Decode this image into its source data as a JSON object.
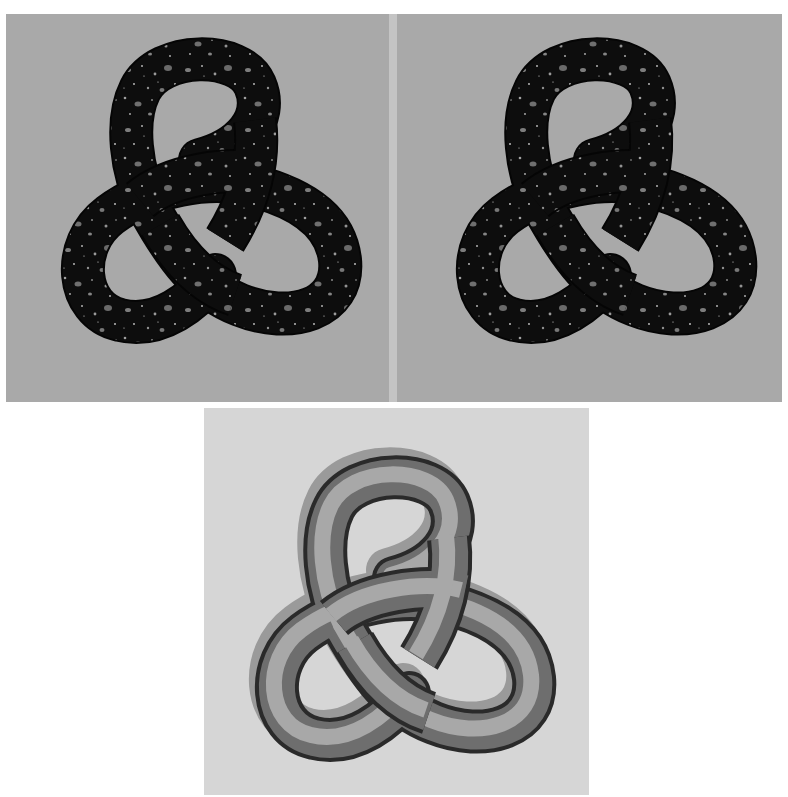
{
  "figure": {
    "panels": [
      {
        "id": "top-left",
        "subject": "trefoil knot",
        "material": "speckled granite / terrazzo texture (dark with light flecks)",
        "background": "#a9a9a9",
        "knot_color": "#111111",
        "speckle_color": "#8c8c8c"
      },
      {
        "id": "top-right",
        "subject": "trefoil knot",
        "material": "speckled granite / terrazzo texture (dark with light flecks), slightly different view",
        "background": "#a9a9a9",
        "knot_color": "#111111",
        "speckle_color": "#8c8c8c"
      },
      {
        "id": "bottom",
        "subject": "trefoil knot",
        "material": "smooth shaded gray tube with offset shadow",
        "background": "#d6d6d6",
        "knot_color": "#8a8a8a",
        "shadow_color": "#9a9a9a"
      }
    ]
  }
}
